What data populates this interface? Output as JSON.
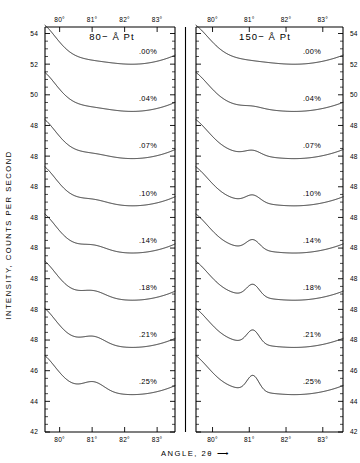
{
  "figure": {
    "background_color": "#ffffff",
    "line_color": "#1a1a1a",
    "axis_color": "#000000"
  },
  "axes": {
    "y_title": "INTENSITY, COUNTS PER SECOND",
    "x_title": "ANGLE, 2θ ⟶",
    "x_ticks": [
      "80°",
      "81°",
      "82°",
      "83°"
    ],
    "y_ticks_top": [
      "54",
      "52",
      "50",
      "48"
    ],
    "y_ticks_repeat": [
      "48",
      "48",
      "48",
      "48",
      "48",
      "48"
    ],
    "y_ticks_bottom": [
      "48",
      "46",
      "44",
      "42"
    ],
    "y_axis_full_labels": [
      "54",
      "52",
      "50",
      "48",
      "48",
      "48",
      "48",
      "48",
      "48",
      "48",
      "48",
      "46",
      "44",
      "42"
    ]
  },
  "panels": [
    {
      "id": "left",
      "title": "80− Å Pt"
    },
    {
      "id": "right",
      "title": "150− Å Pt"
    }
  ],
  "curve_labels": [
    ".00%",
    ".04%",
    ".07%",
    ".10%",
    ".14%",
    ".18%",
    ".21%",
    ".25%"
  ],
  "chart_data": {
    "type": "line",
    "xlabel": "ANGLE, 2θ ⟶",
    "ylabel": "INTENSITY, COUNTS PER SECOND",
    "xlim": [
      79.5,
      83.6
    ],
    "ylim": [
      42,
      55
    ],
    "grid": false,
    "legend": "inline-right-of-each-curve",
    "x_tick_values": [
      80,
      81,
      82,
      83
    ],
    "x_tick_labels": [
      "80°",
      "81°",
      "82°",
      "83°"
    ],
    "y_tick_labels": [
      "54",
      "52",
      "50",
      "48",
      "48",
      "48",
      "48",
      "48",
      "48",
      "48",
      "48",
      "46",
      "44",
      "42"
    ],
    "panels": [
      {
        "name": "80− Å Pt",
        "series": [
          {
            "name": ".00%",
            "peak_angle": null,
            "peak_height": 0.0,
            "peak_width": 0.0,
            "baseline_dip_angle": 82.3,
            "comment": "smooth broad background minimum, no diffraction peak"
          },
          {
            "name": ".04%",
            "peak_angle": 81.05,
            "peak_height": 0.1,
            "peak_width": 0.62,
            "baseline_dip_angle": 82.3
          },
          {
            "name": ".07%",
            "peak_angle": 81.05,
            "peak_height": 0.3,
            "peak_width": 0.58,
            "baseline_dip_angle": 82.3
          },
          {
            "name": ".10%",
            "peak_angle": 81.05,
            "peak_height": 0.55,
            "peak_width": 0.55,
            "baseline_dip_angle": 82.3
          },
          {
            "name": ".14%",
            "peak_angle": 81.05,
            "peak_height": 0.85,
            "peak_width": 0.52,
            "baseline_dip_angle": 82.3
          },
          {
            "name": ".18%",
            "peak_angle": 81.05,
            "peak_height": 1.15,
            "peak_width": 0.5,
            "baseline_dip_angle": 82.4
          },
          {
            "name": ".21%",
            "peak_angle": 81.05,
            "peak_height": 1.45,
            "peak_width": 0.48,
            "baseline_dip_angle": 82.4
          },
          {
            "name": ".25%",
            "peak_angle": 81.05,
            "peak_height": 1.8,
            "peak_width": 0.46,
            "baseline_dip_angle": 82.5
          }
        ]
      },
      {
        "name": "150− Å Pt",
        "series": [
          {
            "name": ".00%",
            "peak_angle": null,
            "peak_height": 0.0,
            "peak_width": 0.0,
            "baseline_dip_angle": 82.3,
            "comment": "smooth broad background minimum, no diffraction peak"
          },
          {
            "name": ".04%",
            "peak_angle": 81.1,
            "peak_height": 0.35,
            "peak_width": 0.34,
            "baseline_dip_angle": 82.3
          },
          {
            "name": ".07%",
            "peak_angle": 81.1,
            "peak_height": 0.95,
            "peak_width": 0.3,
            "baseline_dip_angle": 82.4
          },
          {
            "name": ".10%",
            "peak_angle": 81.1,
            "peak_height": 1.45,
            "peak_width": 0.28,
            "baseline_dip_angle": 82.4
          },
          {
            "name": ".14%",
            "peak_angle": 81.1,
            "peak_height": 1.95,
            "peak_width": 0.26,
            "baseline_dip_angle": 82.5
          },
          {
            "name": ".18%",
            "peak_angle": 81.1,
            "peak_height": 2.45,
            "peak_width": 0.25,
            "baseline_dip_angle": 82.5
          },
          {
            "name": ".21%",
            "peak_angle": 81.1,
            "peak_height": 2.75,
            "peak_width": 0.24,
            "baseline_dip_angle": 82.6
          },
          {
            "name": ".25%",
            "peak_angle": 81.1,
            "peak_height": 3.1,
            "peak_width": 0.23,
            "baseline_dip_angle": 82.6
          }
        ]
      }
    ]
  }
}
